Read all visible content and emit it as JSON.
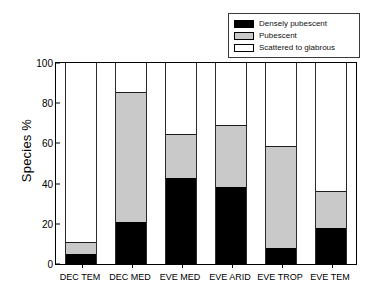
{
  "chart_data": {
    "type": "bar",
    "subtype": "stacked-vertical-100pct",
    "title": "",
    "xlabel": "",
    "ylabel": "Species %",
    "ylim": [
      0,
      100
    ],
    "yticks": [
      0,
      20,
      40,
      60,
      80,
      100
    ],
    "ytick_labels": [
      "0",
      "20",
      "40",
      "60",
      "80",
      "100"
    ],
    "grid": false,
    "legend_position": "top-right",
    "categories": [
      "DEC TEM",
      "DEC MED",
      "EVE MED",
      "EVE ARID",
      "EVE TROP",
      "EVE TEM"
    ],
    "series": [
      {
        "name": "Densely pubescent",
        "color": "#000000",
        "values": [
          5,
          21,
          43,
          38.5,
          8,
          18
        ]
      },
      {
        "name": "Pubescent",
        "color": "#c9c9c9",
        "values": [
          6,
          64.5,
          21.5,
          30.5,
          50.5,
          18.5
        ]
      },
      {
        "name": "Scattered to glabrous",
        "color": "#ffffff",
        "values": [
          89,
          14.5,
          35.5,
          31,
          41.5,
          63.5
        ]
      }
    ],
    "cumulative_tops": {
      "densely_pubescent": [
        5,
        21,
        43,
        38.5,
        8,
        18
      ],
      "pubescent": [
        11,
        85.5,
        64.5,
        69,
        58.5,
        36.5
      ],
      "scattered_to_glabrous": [
        100,
        100,
        100,
        100,
        100,
        100
      ]
    }
  },
  "legend": {
    "items": [
      {
        "label": "Densely pubescent",
        "swatch": "black"
      },
      {
        "label": "Pubescent",
        "swatch": "gray"
      },
      {
        "label": "Scattered to glabrous",
        "swatch": "white"
      }
    ]
  },
  "axes": {
    "y_title": "Species %"
  }
}
